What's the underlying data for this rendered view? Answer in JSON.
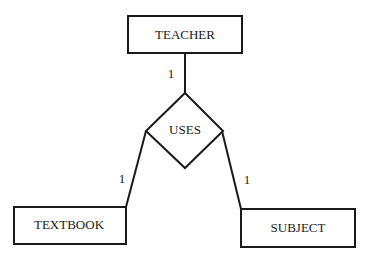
{
  "diagram": {
    "type": "entity-relationship",
    "entities": [
      {
        "id": "teacher",
        "label": "TEACHER"
      },
      {
        "id": "textbook",
        "label": "TEXTBOOK"
      },
      {
        "id": "subject",
        "label": "SUBJECT"
      }
    ],
    "relationship": {
      "id": "uses",
      "label": "USES"
    },
    "cardinalities": {
      "teacher": "1",
      "textbook": "1",
      "subject": "1"
    }
  }
}
